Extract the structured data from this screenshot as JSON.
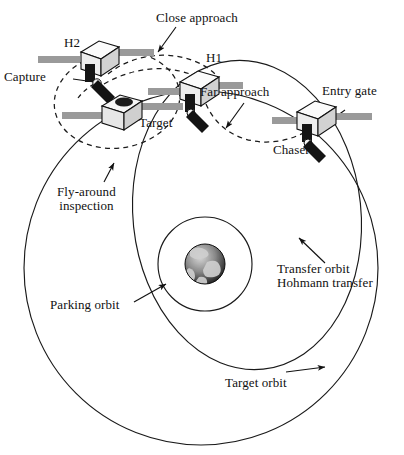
{
  "figure": {
    "type": "diagram",
    "background_color": "#ffffff",
    "line_color": "#1a1a1a",
    "panel_color": "#999999",
    "body_color": "#e8e8e8",
    "dark_color": "#141414"
  },
  "labels": {
    "close_approach": "Close approach",
    "h2": "H2",
    "h1": "H1",
    "capture": "Capture",
    "target": "Target",
    "far_approach": "Far approach",
    "entry_gate": "Entry gate",
    "chaser": "Chaser",
    "fly_around": "Fly-around\ninspection",
    "parking_orbit": "Parking orbit",
    "transfer_orbit": "Transfer orbit\nHohmann transfer",
    "target_orbit": "Target orbit"
  },
  "orbits": [
    {
      "name": "target-orbit",
      "shape": "circle",
      "cx": 201,
      "cy": 268,
      "r": 177,
      "style": "solid"
    },
    {
      "name": "transfer-orbit",
      "shape": "ellipse",
      "cx": 247,
      "cy": 215,
      "rx": 114,
      "ry": 155,
      "style": "solid"
    },
    {
      "name": "parking-orbit",
      "shape": "circle",
      "cx": 205,
      "cy": 264,
      "r": 47,
      "style": "solid"
    },
    {
      "name": "fly-around-inspection",
      "shape": "ellipse",
      "cx": 117,
      "cy": 100,
      "rx": 63,
      "ry": 48,
      "style": "dashed"
    },
    {
      "name": "close-approach-path",
      "shape": "arc",
      "style": "dashed"
    },
    {
      "name": "far-approach-path",
      "shape": "arc",
      "style": "dashed"
    }
  ],
  "spacecraft": [
    {
      "name": "h2",
      "x": 96,
      "y": 62,
      "kind": "chaser-with-arm",
      "has_panels": true
    },
    {
      "name": "target",
      "x": 118,
      "y": 112,
      "kind": "target-module",
      "has_panels": true
    },
    {
      "name": "h1",
      "x": 196,
      "y": 84,
      "kind": "chaser-with-arm",
      "has_panels": true
    },
    {
      "name": "chaser",
      "x": 312,
      "y": 118,
      "kind": "chaser-with-arm",
      "has_panels": true
    }
  ],
  "earth": {
    "name": "earth",
    "cx": 205,
    "cy": 264,
    "r": 20
  }
}
